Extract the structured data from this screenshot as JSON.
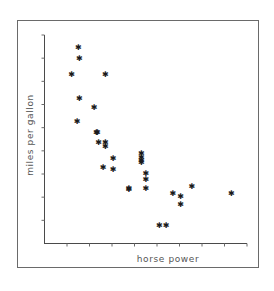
{
  "chart_data": {
    "type": "scatter",
    "title": "",
    "xlabel": "horse power",
    "ylabel": "miles per gallon",
    "xlim": [
      0,
      9
    ],
    "ylim": [
      0,
      9
    ],
    "x_ticks": 9,
    "y_ticks": 9,
    "tick_labels_shown": false,
    "grid": false,
    "legend": null,
    "marker": "✱",
    "series": [
      {
        "name": "cars",
        "points": [
          [
            1.5,
            8.5
          ],
          [
            1.55,
            8.0
          ],
          [
            1.2,
            7.3
          ],
          [
            2.7,
            7.3
          ],
          [
            1.55,
            6.3
          ],
          [
            2.2,
            5.9
          ],
          [
            1.45,
            5.3
          ],
          [
            2.3,
            4.8
          ],
          [
            2.35,
            4.8
          ],
          [
            2.4,
            4.4
          ],
          [
            2.7,
            4.4
          ],
          [
            2.7,
            4.2
          ],
          [
            2.6,
            3.3
          ],
          [
            3.05,
            3.7
          ],
          [
            3.05,
            3.2
          ],
          [
            3.75,
            2.4
          ],
          [
            3.75,
            2.35
          ],
          [
            4.3,
            3.9
          ],
          [
            4.3,
            3.75
          ],
          [
            4.3,
            3.6
          ],
          [
            4.3,
            3.5
          ],
          [
            4.5,
            3.05
          ],
          [
            4.5,
            2.8
          ],
          [
            4.5,
            2.4
          ],
          [
            5.1,
            0.8
          ],
          [
            5.4,
            0.8
          ],
          [
            5.7,
            2.2
          ],
          [
            6.05,
            2.05
          ],
          [
            6.05,
            1.7
          ],
          [
            6.55,
            2.5
          ],
          [
            8.3,
            2.2
          ]
        ]
      }
    ]
  },
  "figure": {
    "x_axis_label": "horse power",
    "y_axis_label": "miles per gallon"
  }
}
